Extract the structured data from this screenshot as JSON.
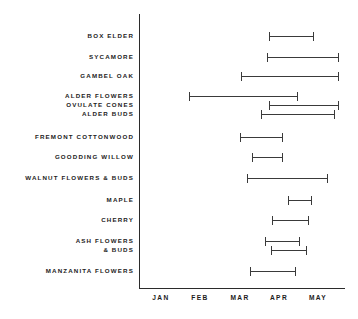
{
  "chart_data": {
    "type": "bar",
    "subtype": "range-interval",
    "title": "",
    "subtitle": "",
    "xlabel": "",
    "ylabel": "",
    "orientation": "horizontal",
    "grid": false,
    "legend": null,
    "x_tick_labels": [
      "JAN",
      "FEB",
      "MAR",
      "APR",
      "MAY"
    ],
    "x_tick_values": [
      1,
      2,
      3,
      4,
      5
    ],
    "xlim": [
      0.5,
      5.7
    ],
    "x_units": "month",
    "axis_color": "#2b2b2b",
    "bar_color": "#3a3a3a",
    "categories": [
      "BOX ELDER",
      "SYCAMORE",
      "GAMBEL OAK",
      "ALDER FLOWERS",
      "OVULATE  CONES",
      "ALDER BUDS",
      "FREMONT COTTONWOOD",
      "GOODDING WILLOW",
      "WALNUT FLOWERS & BUDS",
      "MAPLE",
      "CHERRY",
      "ASH FLOWERS",
      "& BUDS",
      "MANZANITA FLOWERS"
    ],
    "series": [
      {
        "name": "phenological period",
        "ranges": [
          {
            "category": "BOX ELDER",
            "start": 3.76,
            "end": 4.9
          },
          {
            "category": "SYCAMORE",
            "start": 3.71,
            "end": 5.53
          },
          {
            "category": "GAMBEL OAK",
            "start": 3.05,
            "end": 5.53
          },
          {
            "category": "ALDER FLOWERS",
            "start": 1.71,
            "end": 4.48
          },
          {
            "category": "OVULATE  CONES",
            "start": 3.76,
            "end": 5.53
          },
          {
            "category": "ALDER BUDS",
            "start": 3.56,
            "end": 5.43
          },
          {
            "category": "FREMONT COTTONWOOD",
            "start": 3.0,
            "end": 4.11
          },
          {
            "category": "GOODDING WILLOW",
            "start": 3.31,
            "end": 4.11
          },
          {
            "category": "WALNUT FLOWERS & BUDS",
            "start": 3.18,
            "end": 5.25
          },
          {
            "category": "MAPLE",
            "start": 4.23,
            "end": 4.84
          },
          {
            "category": "CHERRY",
            "start": 3.82,
            "end": 4.76
          },
          {
            "category": "ASH FLOWERS",
            "start": 3.64,
            "end": 4.53
          },
          {
            "category": "& BUDS",
            "start": 3.79,
            "end": 4.73
          },
          {
            "category": "MANZANITA FLOWERS",
            "start": 3.26,
            "end": 4.43
          }
        ]
      }
    ]
  },
  "layout": {
    "row_y": [
      36,
      57,
      76,
      96,
      105,
      114,
      137,
      157,
      178,
      200,
      220,
      241,
      250,
      271
    ],
    "label_y": [
      32,
      53,
      72,
      92,
      101,
      110,
      133,
      153,
      174,
      196,
      216,
      237,
      246,
      267
    ],
    "axis_x": 139,
    "axis_y": 288,
    "axis_right": 345,
    "month_x": [
      161,
      200,
      240,
      279,
      318
    ]
  }
}
